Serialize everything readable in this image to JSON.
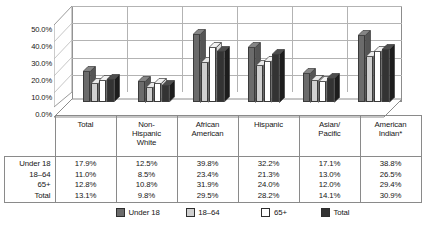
{
  "chart_data": {
    "type": "bar",
    "title": "",
    "subtitle": "",
    "xlabel": "",
    "ylabel": "",
    "ylim": [
      0,
      50
    ],
    "grid": true,
    "legend_position": "bottom",
    "categories": [
      "Total",
      "Non-Hispanic White",
      "African American",
      "Hispanic",
      "Asian/ Pacific",
      "American Indian*"
    ],
    "series": [
      {
        "name": "Under 18",
        "color": "#6b6b6b",
        "values": [
          17.9,
          12.5,
          39.8,
          32.2,
          17.1,
          38.8
        ]
      },
      {
        "name": "18–64",
        "color": "#cfcfcf",
        "values": [
          11.0,
          8.5,
          23.4,
          21.3,
          13.0,
          26.5
        ]
      },
      {
        "name": "65+",
        "color": "#ffffff",
        "values": [
          12.8,
          10.8,
          31.9,
          24.0,
          12.0,
          29.4
        ]
      },
      {
        "name": "Total",
        "color": "#333333",
        "values": [
          13.1,
          9.8,
          29.5,
          28.2,
          14.1,
          30.9
        ]
      }
    ],
    "yticks": [
      "0.0%",
      "10.0%",
      "20.0%",
      "30.0%",
      "40.0%",
      "50.0%"
    ],
    "ytick_values": [
      0,
      10,
      20,
      30,
      40,
      50
    ]
  },
  "axis": {
    "yticks": [
      "50.0%",
      "40.0%",
      "30.0%",
      "20.0%",
      "10.0%",
      "0.0%"
    ]
  },
  "table": {
    "corner_label": "",
    "columns": [
      {
        "lines": [
          "Total"
        ]
      },
      {
        "lines": [
          "Non-",
          "Hispanic",
          "White"
        ]
      },
      {
        "lines": [
          "African",
          "American"
        ]
      },
      {
        "lines": [
          "Hispanic"
        ]
      },
      {
        "lines": [
          "Asian/",
          "Pacific"
        ]
      },
      {
        "lines": [
          "American",
          "Indian*"
        ]
      }
    ],
    "rows": [
      {
        "label": "Under 18",
        "values": [
          "17.9%",
          "12.5%",
          "39.8%",
          "32.2%",
          "17.1%",
          "38.8%"
        ]
      },
      {
        "label": "18–64",
        "values": [
          "11.0%",
          "8.5%",
          "23.4%",
          "21.3%",
          "13.0%",
          "26.5%"
        ]
      },
      {
        "label": "65+",
        "values": [
          "12.8%",
          "10.8%",
          "31.9%",
          "24.0%",
          "12.0%",
          "29.4%"
        ]
      },
      {
        "label": "Total",
        "values": [
          "13.1%",
          "9.8%",
          "29.5%",
          "28.2%",
          "14.1%",
          "30.9%"
        ]
      }
    ]
  },
  "legend": {
    "items": [
      {
        "label": "Under 18",
        "color": "#6b6b6b"
      },
      {
        "label": "18–64",
        "color": "#cfcfcf"
      },
      {
        "label": "65+",
        "color": "#ffffff"
      },
      {
        "label": "Total",
        "color": "#333333"
      }
    ]
  }
}
